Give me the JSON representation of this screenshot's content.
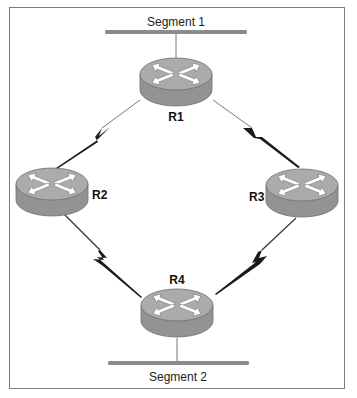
{
  "diagram": {
    "type": "network-topology",
    "colors": {
      "border": "#7a7a7a",
      "segment_bar": "#8c8c8c",
      "router_top": "#a9a9a9",
      "router_side": "#939393",
      "router_outline": "#6e6e6e",
      "arrow_fill": "#ffffff",
      "link": "#1a1a1a"
    },
    "segments": [
      {
        "id": "seg1",
        "label": "Segment 1"
      },
      {
        "id": "seg2",
        "label": "Segment 2"
      }
    ],
    "routers": [
      {
        "id": "R1",
        "label": "R1",
        "icon": "router-icon"
      },
      {
        "id": "R2",
        "label": "R2",
        "icon": "router-icon"
      },
      {
        "id": "R3",
        "label": "R3",
        "icon": "router-icon"
      },
      {
        "id": "R4",
        "label": "R4",
        "icon": "router-icon"
      }
    ],
    "links": [
      {
        "from": "Segment 1",
        "to": "R1",
        "type": "ethernet"
      },
      {
        "from": "R1",
        "to": "R2",
        "type": "serial-wan"
      },
      {
        "from": "R1",
        "to": "R3",
        "type": "serial-wan"
      },
      {
        "from": "R2",
        "to": "R4",
        "type": "serial-wan"
      },
      {
        "from": "R3",
        "to": "R4",
        "type": "serial-wan"
      },
      {
        "from": "R4",
        "to": "Segment 2",
        "type": "ethernet"
      }
    ]
  }
}
